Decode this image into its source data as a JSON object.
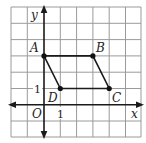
{
  "figure": {
    "type": "coordinate-plane-parallelogram",
    "axes": {
      "x_label": "x",
      "y_label": "y",
      "origin_label": "O",
      "x_tick_label": "1",
      "y_tick_label": "1"
    },
    "grid": {
      "x_min": -2,
      "x_max": 6,
      "y_min": -2,
      "y_max": 6
    },
    "points": [
      {
        "name": "A",
        "x": 0,
        "y": 3
      },
      {
        "name": "B",
        "x": 3,
        "y": 3
      },
      {
        "name": "C",
        "x": 4,
        "y": 1
      },
      {
        "name": "D",
        "x": 1,
        "y": 1
      }
    ],
    "polygon": [
      "A",
      "B",
      "C",
      "D"
    ]
  }
}
